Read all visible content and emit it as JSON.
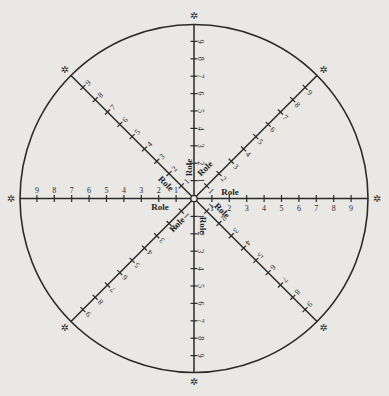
{
  "diagram": {
    "type": "radial-role-spectrogram",
    "center": {
      "x": 194,
      "y": 198.5
    },
    "radius": 174,
    "tick_spacing": 17.4,
    "tick_labels": [
      "1",
      "2",
      "3",
      "4",
      "5",
      "6",
      "7",
      "8",
      "9"
    ],
    "axis_marker": "✲",
    "center_marker": "small-circle",
    "colors": {
      "ink": "#2a2a2a",
      "background": "#e9e8e4"
    },
    "axes": [
      {
        "id": "north",
        "angle": -90,
        "role_label": "Role"
      },
      {
        "id": "north-east",
        "angle": -45,
        "role_label": "Role"
      },
      {
        "id": "east",
        "angle": 0,
        "role_label": "Role"
      },
      {
        "id": "south-east",
        "angle": 45,
        "role_label": "Role"
      },
      {
        "id": "south",
        "angle": 90,
        "role_label": "Role"
      },
      {
        "id": "south-west",
        "angle": 135,
        "role_label": "Role"
      },
      {
        "id": "west",
        "angle": 180,
        "role_label": "Role"
      },
      {
        "id": "north-west",
        "angle": -135,
        "role_label": "Role"
      }
    ]
  }
}
